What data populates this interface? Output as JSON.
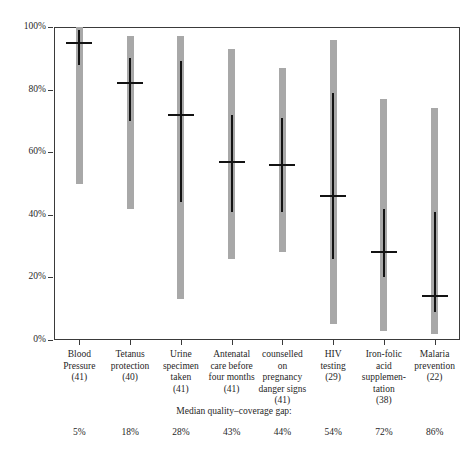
{
  "chart_data": {
    "type": "bar",
    "title": "",
    "xlabel": "",
    "ylabel": "",
    "ylim": [
      0,
      100
    ],
    "grid": false,
    "legend_position": "none",
    "y_ticks": [
      {
        "value": 100,
        "label": "100%"
      },
      {
        "value": 80,
        "label": "80%"
      },
      {
        "value": 60,
        "label": "60%"
      },
      {
        "value": 40,
        "label": "40%"
      },
      {
        "value": 20,
        "label": "20%"
      },
      {
        "value": 0,
        "label": "0%"
      }
    ],
    "categories": [
      "Blood Pressure",
      "Tetanus protection",
      "Urine specimen taken",
      "Antenatal care before four months",
      "counselled on pregnancy danger signs",
      "HIV testing",
      "Iron-folic acid supplementation",
      "Malaria prevention"
    ],
    "category_lines": [
      [
        "Blood",
        "Pressure"
      ],
      [
        "Tetanus",
        "protection"
      ],
      [
        "Urine",
        "specimen",
        "taken"
      ],
      [
        "Antenatal",
        "care before",
        "four months"
      ],
      [
        "counselled",
        "on",
        "pregnancy",
        "danger signs"
      ],
      [
        "HIV",
        "testing"
      ],
      [
        "Iron-folic",
        "acid",
        "supplemen-",
        "tation"
      ],
      [
        "Malaria",
        "prevention"
      ]
    ],
    "counts": [
      41,
      40,
      41,
      41,
      41,
      29,
      38,
      22
    ],
    "count_labels": [
      "(41)",
      "(40)",
      "(41)",
      "(41)",
      "(41)",
      "(29)",
      "(38)",
      "(22)"
    ],
    "series": [
      {
        "name": "full range",
        "color": "#a8a8a8",
        "values": [
          {
            "min": 50,
            "max": 100
          },
          {
            "min": 42,
            "max": 97
          },
          {
            "min": 13,
            "max": 97
          },
          {
            "min": 26,
            "max": 93
          },
          {
            "min": 28,
            "max": 87
          },
          {
            "min": 5,
            "max": 96
          },
          {
            "min": 3,
            "max": 77
          },
          {
            "min": 2,
            "max": 74
          }
        ]
      },
      {
        "name": "interquartile range",
        "color": "#131313",
        "values": [
          {
            "min": 88,
            "max": 99
          },
          {
            "min": 70,
            "max": 90
          },
          {
            "min": 44,
            "max": 89
          },
          {
            "min": 41,
            "max": 72
          },
          {
            "min": 41,
            "max": 71
          },
          {
            "min": 26,
            "max": 79
          },
          {
            "min": 20,
            "max": 42
          },
          {
            "min": 9,
            "max": 41
          }
        ]
      },
      {
        "name": "median",
        "color": "#131313",
        "values": [
          95,
          82,
          72,
          57,
          56,
          46,
          28,
          14
        ]
      }
    ],
    "footer_label": "Median quality–coverage gap:",
    "gap_values": [
      5,
      18,
      28,
      43,
      44,
      54,
      72,
      86
    ],
    "gap_labels": [
      "5%",
      "18%",
      "28%",
      "43%",
      "44%",
      "54%",
      "72%",
      "86%"
    ]
  }
}
